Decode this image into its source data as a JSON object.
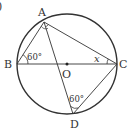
{
  "figure": {
    "corner_mark": ")",
    "colors": {
      "stroke": "#333333",
      "background": "#ffffff"
    },
    "circle": {
      "center_label": "O",
      "cx": 67,
      "cy": 64,
      "r": 50
    },
    "points": {
      "A": {
        "label": "A",
        "x": 44,
        "y": 22
      },
      "B": {
        "label": "B",
        "x": 17,
        "y": 64
      },
      "C": {
        "label": "C",
        "x": 117,
        "y": 64
      },
      "D": {
        "label": "D",
        "x": 73,
        "y": 114
      }
    },
    "segments": [
      "AB",
      "AC",
      "AD",
      "BC",
      "CD"
    ],
    "angles": {
      "ABC": "60°",
      "ACB": "x",
      "ADC": "60°"
    }
  }
}
